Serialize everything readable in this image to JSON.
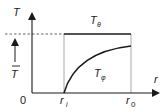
{
  "diagram": {
    "type": "temperature-profile",
    "labels": {
      "y_axis": "T",
      "x_axis": "r",
      "origin": "0",
      "r_inner": "r",
      "r_inner_sub": "i",
      "r_outer": "r",
      "r_outer_sub": "0",
      "t_theta": "T",
      "t_theta_sub": "θ",
      "t_phi": "T",
      "t_phi_sub": "φ",
      "t_bar": "T"
    },
    "colors": {
      "line": "#1a1a1a",
      "guide": "#9a9a9a",
      "text": "#222222"
    },
    "curves": [
      {
        "name": "T_theta",
        "shape": "constant",
        "from": "r_i",
        "to": "r_0",
        "level": "T_bar"
      },
      {
        "name": "T_phi",
        "shape": "increasing-concave",
        "from": "r_i",
        "to": "r_0",
        "start": 0
      }
    ]
  }
}
